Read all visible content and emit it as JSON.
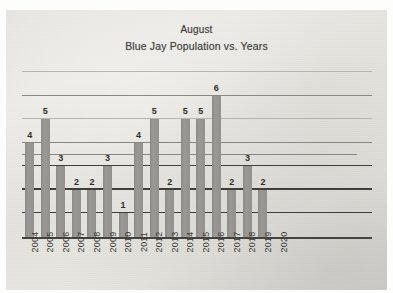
{
  "slide": {
    "title": "August",
    "subtitle": "Blue Jay Population vs. Years"
  },
  "colors": {
    "slide_background": "#e8e6e2",
    "bar_fill": "#93919d",
    "bar_fill_hex": "#93918d",
    "axis_line": "#44433f",
    "gridline_light": "#b4b2ae",
    "gridline_dark": "#3f3e3c",
    "label_text": "#2e2d2b",
    "title_text": "#3b3a38"
  },
  "chart_data": {
    "type": "bar",
    "title": "August",
    "subtitle": "Blue Jay Population vs. Years",
    "xlabel": "",
    "ylabel": "",
    "ylim": [
      0,
      7
    ],
    "grid": true,
    "grid_values": [
      1,
      2,
      3,
      3.5,
      4,
      5,
      6,
      7
    ],
    "legend": "none",
    "data_labels": true,
    "categories": [
      "2004",
      "2005",
      "2006",
      "2007",
      "2008",
      "2009",
      "2010",
      "2011",
      "2012",
      "2013",
      "2014",
      "2015",
      "2016",
      "2017",
      "2018",
      "2019",
      "2020"
    ],
    "values": [
      4,
      5,
      3,
      2,
      2,
      3,
      1,
      4,
      5,
      2,
      5,
      5,
      6,
      2,
      3,
      2,
      null
    ],
    "value_labels": [
      "4",
      "5",
      "3",
      "2",
      "2",
      "3",
      "1",
      "4",
      "5",
      "2",
      "5",
      "5",
      "6",
      "2",
      "3",
      "2",
      ""
    ]
  }
}
